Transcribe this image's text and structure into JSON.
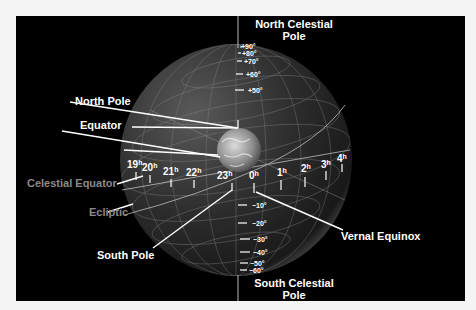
{
  "diagram": {
    "title_labels": {
      "north_celestial_pole": [
        "North Celestial",
        "Pole"
      ],
      "south_celestial_pole": [
        "South Celestial",
        "Pole"
      ],
      "north_pole": "North Pole",
      "equator": "Equator",
      "celestial_equator": "Celestial Equator",
      "ecliptic": "Ecliptic",
      "south_pole": "South Pole",
      "vernal_equinox": "Vernal Equinox"
    },
    "declinations_north": [
      "+90°",
      "+80°",
      "+70°",
      "+60°",
      "+50°"
    ],
    "declinations_south": [
      "−10°",
      "−20°",
      "−30°",
      "−40°",
      "−50°",
      "−60°"
    ],
    "right_ascension": [
      {
        "num": "19",
        "unit": "h"
      },
      {
        "num": "20",
        "unit": "h"
      },
      {
        "num": "21",
        "unit": "h"
      },
      {
        "num": "22",
        "unit": "h"
      },
      {
        "num": "23",
        "unit": "h"
      },
      {
        "num": "0",
        "unit": "h"
      },
      {
        "num": "1",
        "unit": "h"
      },
      {
        "num": "2",
        "unit": "h"
      },
      {
        "num": "3",
        "unit": "h"
      },
      {
        "num": "4",
        "unit": "h"
      }
    ],
    "colors": {
      "background": "#000000",
      "page": "#f4f4f4",
      "label": "#ffffff",
      "secondary_label": "#8a8a8a",
      "sphere_grid": "#9a9a9a"
    }
  }
}
